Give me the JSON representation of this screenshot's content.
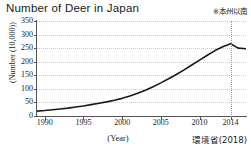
{
  "header": {
    "title": "Number of Deer in Japan",
    "note": "※本州以南"
  },
  "footer": {
    "source": "環境省(2018)"
  },
  "chart_data": {
    "type": "line",
    "title": "Number of Deer in Japan",
    "annotations": [
      "※本州以南",
      "環境省(2018)"
    ],
    "xlabel": "(Year)",
    "ylabel": "(Number (10,000))",
    "xlim": [
      1989,
      2016
    ],
    "ylim": [
      0,
      350
    ],
    "grid": true,
    "legend": false,
    "xticks": [
      1990,
      1995,
      2000,
      2005,
      2010,
      2014
    ],
    "xtick_labels": [
      "1990",
      "1995",
      "2000",
      "2005",
      "2010",
      "2014"
    ],
    "yticks": [
      0,
      50,
      100,
      150,
      200,
      250,
      300,
      350
    ],
    "ytick_labels": [
      "0",
      "50",
      "100",
      "150",
      "200",
      "250",
      "300",
      "350"
    ],
    "marker_line_x": 2014,
    "series": [
      {
        "name": "Deer population (Honshu and south)",
        "color": "#1a1a1a",
        "x": [
          1989,
          1990,
          1991,
          1992,
          1993,
          1994,
          1995,
          1996,
          1997,
          1998,
          1999,
          2000,
          2001,
          2002,
          2003,
          2004,
          2005,
          2006,
          2007,
          2008,
          2009,
          2010,
          2011,
          2012,
          2013,
          2014,
          2015,
          2016
        ],
        "values": [
          18,
          20,
          23,
          26,
          29,
          33,
          37,
          42,
          47,
          52,
          58,
          65,
          74,
          84,
          95,
          108,
          122,
          137,
          153,
          170,
          188,
          206,
          224,
          241,
          255,
          266,
          250,
          248
        ]
      }
    ]
  }
}
